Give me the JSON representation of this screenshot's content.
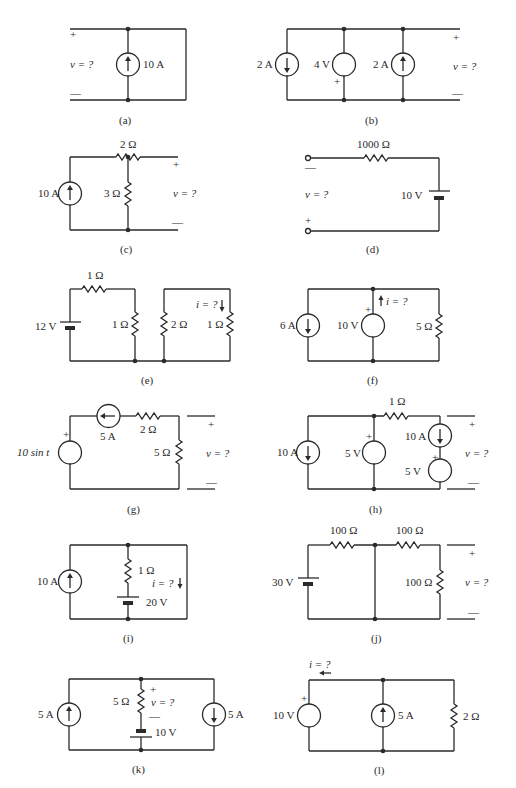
{
  "figure": {
    "circuits": {
      "a": {
        "caption": "(a)",
        "source": "10 A",
        "unknown": "v = ?",
        "plus": "+",
        "minus": "—"
      },
      "b": {
        "caption": "(b)",
        "source1": "2 A",
        "source2": "4 V",
        "source3": "2 A",
        "unknown": "v = ?",
        "plus": "+",
        "minus": "—",
        "src2_plus": "+"
      },
      "c": {
        "caption": "(c)",
        "source": "10 A",
        "r1": "2 Ω",
        "r2": "3 Ω",
        "unknown": "v = ?",
        "plus": "+",
        "minus": "—"
      },
      "d": {
        "caption": "(d)",
        "r1": "1000 Ω",
        "battery": "10 V",
        "unknown": "v = ?",
        "plus": "+",
        "minus": "—"
      },
      "e": {
        "caption": "(e)",
        "battery": "12 V",
        "r1": "1 Ω",
        "r2": "1 Ω",
        "r3": "2 Ω",
        "r4": "1 Ω",
        "unknown": "i = ?"
      },
      "f": {
        "caption": "(f)",
        "source1": "6 A",
        "source2": "10 V",
        "r1": "5 Ω",
        "unknown": "i = ?",
        "src2_plus": "+"
      },
      "g": {
        "caption": "(g)",
        "source1": "10 sin t",
        "source2": "5 A",
        "r1": "2 Ω",
        "r2": "5 Ω",
        "unknown": "v = ?",
        "plus": "+",
        "minus": "—",
        "src1_plus": "+"
      },
      "h": {
        "caption": "(h)",
        "source1": "10 A",
        "source2": "5 V",
        "r1": "1 Ω",
        "source3": "10 A",
        "source4": "5 V",
        "unknown": "v = ?",
        "plus": "+",
        "minus": "—",
        "src2_plus": "+",
        "src4_plus": "+"
      },
      "i": {
        "caption": "(i)",
        "source": "10 A",
        "r1": "1 Ω",
        "battery": "20 V",
        "unknown": "i = ?"
      },
      "j": {
        "caption": "(j)",
        "battery": "30 V",
        "r1": "100 Ω",
        "r2": "100 Ω",
        "r3": "100 Ω",
        "unknown": "v = ?",
        "plus": "+",
        "minus": "—"
      },
      "k": {
        "caption": "(k)",
        "source1": "5 A",
        "r1": "5 Ω",
        "battery": "10 V",
        "source2": "5 A",
        "unknown": "v = ?",
        "plus": "+",
        "minus": "—"
      },
      "l": {
        "caption": "(l)",
        "source1": "10 V",
        "source2": "5 A",
        "r1": "2 Ω",
        "unknown": "i = ?",
        "src1_plus": "+"
      }
    }
  }
}
